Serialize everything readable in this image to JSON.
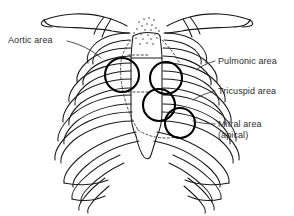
{
  "figure": {
    "type": "anatomical-diagram",
    "background_color": "#ffffff",
    "ink_color": "#1a1a1a",
    "text_color": "#2b2b2b",
    "marker_color": "#000000"
  },
  "labels": {
    "aortic": "Aortic area",
    "pulmonic": "Pulmonic area",
    "tricuspid": "Tricuspid area",
    "mitral_line1": "Mitral area",
    "mitral_line2": "(apical)"
  },
  "auscultation_points": [
    {
      "name": "aortic-area",
      "side": "patient-right",
      "cx": 122,
      "cy": 75,
      "r": 17
    },
    {
      "name": "pulmonic-area",
      "side": "patient-left",
      "cx": 166,
      "cy": 78,
      "r": 16
    },
    {
      "name": "tricuspid-area",
      "side": "patient-left",
      "cx": 159,
      "cy": 105,
      "r": 16
    },
    {
      "name": "mitral-area",
      "side": "patient-left",
      "cx": 180,
      "cy": 123,
      "r": 15
    }
  ],
  "anatomy_parts": [
    "clavicle-left",
    "clavicle-right",
    "sternum-manubrium",
    "sternum-body",
    "xiphoid-process",
    "ribs-left",
    "ribs-right",
    "costal-margin-left",
    "costal-margin-right"
  ]
}
